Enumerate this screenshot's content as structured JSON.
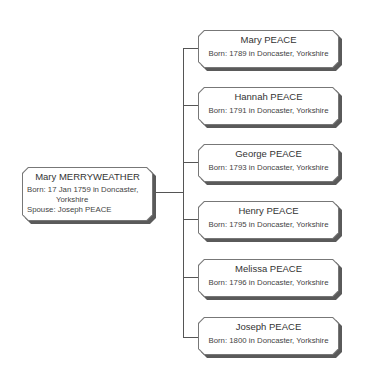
{
  "parent": {
    "name": "Mary MERRYWEATHER",
    "born_line1": "Born: 17 Jan 1759 in Doncaster,",
    "born_line2": "Yorkshire",
    "spouse": "Spouse: Joseph PEACE"
  },
  "children": [
    {
      "name": "Mary PEACE",
      "born": "Born: 1789 in Doncaster, Yorkshire"
    },
    {
      "name": "Hannah PEACE",
      "born": "Born: 1791 in Doncaster, Yorkshire"
    },
    {
      "name": "George PEACE",
      "born": "Born: 1793 in Doncaster, Yorkshire"
    },
    {
      "name": "Henry PEACE",
      "born": "Born: 1795 in Doncaster, Yorkshire"
    },
    {
      "name": "Melissa PEACE",
      "born": "Born: 1796 in Doncaster, Yorkshire"
    },
    {
      "name": "Joseph PEACE",
      "born": "Born: 1800 in Doncaster, Yorkshire"
    }
  ],
  "colors": {
    "line": "#555555",
    "border": "#777777",
    "shadow": "#5a5a5a",
    "fill": "#ffffff"
  }
}
